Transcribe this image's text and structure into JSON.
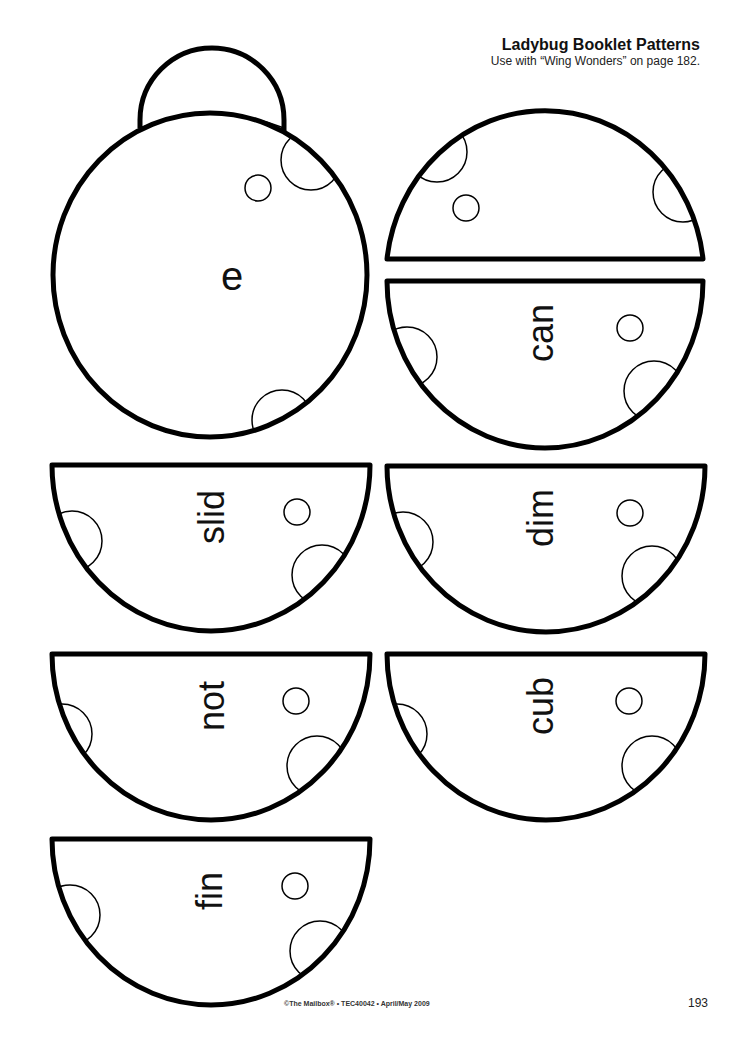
{
  "header": {
    "title": "Ladybug Booklet Patterns",
    "subtitle": "Use with “Wing Wonders” on page 182."
  },
  "body_piece": {
    "letter": "e"
  },
  "pieces": [
    {
      "word": "can"
    },
    {
      "word": "slid"
    },
    {
      "word": "dim"
    },
    {
      "word": "not"
    },
    {
      "word": "cub"
    },
    {
      "word": "fin"
    }
  ],
  "footer": {
    "credit": "©The Mailbox® • TEC40042 • April/May 2009",
    "page_number": "193"
  },
  "colors": {
    "outline": "#000000",
    "background": "#ffffff"
  }
}
